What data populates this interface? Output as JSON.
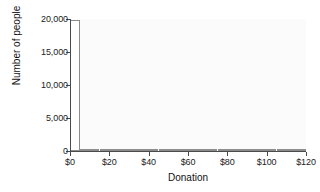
{
  "chart_data": {
    "type": "bar",
    "title": "",
    "subtitle": "",
    "xlabel": "Donation",
    "ylabel": "Number of people",
    "xlim": [
      0,
      120
    ],
    "ylim": [
      0,
      20000
    ],
    "grid": false,
    "legend": null,
    "bin_width": 5,
    "x_tick_labels": [
      "$0",
      "$20",
      "$40",
      "$60",
      "$80",
      "$100",
      "$120"
    ],
    "x_tick_values": [
      0,
      20,
      40,
      60,
      80,
      100,
      120
    ],
    "y_tick_labels": [
      "0",
      "5,000",
      "10,000",
      "15,000",
      "20,000"
    ],
    "y_tick_values": [
      0,
      5000,
      10000,
      15000,
      20000
    ],
    "bin_starts": [
      0,
      5,
      10,
      15,
      20,
      25,
      30,
      35,
      40,
      45,
      50,
      55,
      60,
      65,
      70,
      75,
      80,
      85,
      90,
      95,
      100,
      105,
      110,
      115
    ],
    "values": [
      19800,
      120,
      330,
      170,
      300,
      190,
      60,
      20,
      15,
      10,
      12,
      6,
      10,
      4,
      4,
      3,
      6,
      2,
      2,
      2,
      4,
      1,
      1,
      1
    ],
    "bar_fill": "#ffffff",
    "bar_stroke": "#8d8d8d",
    "plot_background": "#fbfbfb",
    "axis_color": "#4a4a4a",
    "text_color": "#222222"
  }
}
